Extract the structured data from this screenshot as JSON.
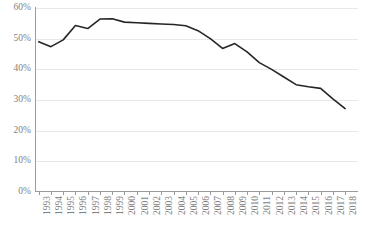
{
  "chart_data": {
    "type": "line",
    "title": "",
    "subtitle": "",
    "xlabel": "",
    "ylabel": "",
    "ylim": [
      0,
      60
    ],
    "ytick_step": 10,
    "grid": true,
    "legend": false,
    "legend_position": "none",
    "line_color": "#262626",
    "grid_color": "#e8e8e8",
    "axis_color": "#9a9a9a",
    "tick_label_color": "#7f7f7f",
    "ytick_labels": [
      "60%",
      "50%",
      "40%",
      "30%",
      "20%",
      "10%",
      "0%"
    ],
    "ytick_values": [
      60,
      50,
      40,
      30,
      20,
      10,
      0
    ],
    "categories": [
      "1993",
      "1994",
      "1995",
      "1996",
      "1997",
      "1998",
      "1999",
      "2000",
      "2001",
      "2002",
      "2003",
      "2004",
      "2005",
      "2006",
      "2007",
      "2008",
      "2009",
      "2010",
      "2011",
      "2012",
      "2013",
      "2014",
      "2015",
      "2016",
      "2017",
      "2018"
    ],
    "values": [
      49.0,
      47.4,
      49.6,
      54.3,
      53.3,
      56.4,
      56.5,
      55.4,
      55.2,
      55.0,
      54.8,
      54.6,
      54.2,
      52.6,
      50.0,
      46.8,
      48.4,
      45.7,
      42.2,
      40.0,
      37.5,
      35.0,
      34.3,
      33.8,
      30.4,
      27.2
    ]
  }
}
